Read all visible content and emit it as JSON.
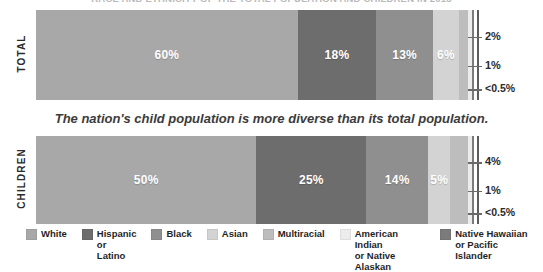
{
  "title": "RACE AND ETHNICITY OF THE TOTAL POPULATION AND CHILDREN IN 2018",
  "caption": "The nation's child population is more diverse than its total population.",
  "colors": {
    "white": "#a8a8a8",
    "hispanic_or_latino": "#6d6d6d",
    "black": "#8f8f8f",
    "asian": "#d3d3d3",
    "multiracial": "#bdbdbd",
    "american_indian_or_native_alaskan": "#ececec",
    "native_hawaiian_or_pacific_islander": "#7b7b7b",
    "axis": "#5b5b5b",
    "label_text": "#2b2b2b",
    "segment_text": "#ffffff"
  },
  "rows": [
    {
      "label": "TOTAL",
      "segments": [
        {
          "name": "White",
          "value": 60,
          "display": "60%",
          "show_label": true,
          "color_key": "white"
        },
        {
          "name": "Hispanic or Latino",
          "value": 18,
          "display": "18%",
          "show_label": true,
          "color_key": "hispanic_or_latino"
        },
        {
          "name": "Black",
          "value": 13,
          "display": "13%",
          "show_label": true,
          "color_key": "black"
        },
        {
          "name": "Asian",
          "value": 6,
          "display": "6%",
          "show_label": true,
          "color_key": "asian"
        },
        {
          "name": "Multiracial",
          "value": 2,
          "display": "2%",
          "show_label": false,
          "color_key": "multiracial"
        },
        {
          "name": "American Indian or Native Alaskan",
          "value": 1,
          "display": "1%",
          "show_label": false,
          "color_key": "american_indian_or_native_alaskan"
        },
        {
          "name": "Native Hawaiian or Pacific Islander",
          "value": 0.4,
          "display": "<0.5%",
          "show_label": false,
          "color_key": "native_hawaiian_or_pacific_islander"
        }
      ],
      "ticks": [
        {
          "label": "2%",
          "position_pct": 96.0
        },
        {
          "label": "1%",
          "position_pct": 98.5
        },
        {
          "label": "<0.5%",
          "position_pct": 99.8
        }
      ]
    },
    {
      "label": "CHILDREN",
      "segments": [
        {
          "name": "White",
          "value": 50,
          "display": "50%",
          "show_label": true,
          "color_key": "white"
        },
        {
          "name": "Hispanic or Latino",
          "value": 25,
          "display": "25%",
          "show_label": true,
          "color_key": "hispanic_or_latino"
        },
        {
          "name": "Black",
          "value": 14,
          "display": "14%",
          "show_label": true,
          "color_key": "black"
        },
        {
          "name": "Asian",
          "value": 5,
          "display": "5%",
          "show_label": true,
          "color_key": "asian"
        },
        {
          "name": "Multiracial",
          "value": 4,
          "display": "4%",
          "show_label": false,
          "color_key": "multiracial"
        },
        {
          "name": "American Indian or Native Alaskan",
          "value": 1,
          "display": "1%",
          "show_label": false,
          "color_key": "american_indian_or_native_alaskan"
        },
        {
          "name": "Native Hawaiian or Pacific Islander",
          "value": 0.4,
          "display": "<0.5%",
          "show_label": false,
          "color_key": "native_hawaiian_or_pacific_islander"
        }
      ],
      "ticks": [
        {
          "label": "4%",
          "position_pct": 95.5
        },
        {
          "label": "1%",
          "position_pct": 98.5
        },
        {
          "label": "<0.5%",
          "position_pct": 99.8
        }
      ]
    }
  ],
  "legend": [
    {
      "label_line1": "White",
      "label_line2": "",
      "color_key": "white"
    },
    {
      "label_line1": "Hispanic",
      "label_line2": "or Latino",
      "color_key": "hispanic_or_latino"
    },
    {
      "label_line1": "Black",
      "label_line2": "",
      "color_key": "black"
    },
    {
      "label_line1": "Asian",
      "label_line2": "",
      "color_key": "asian"
    },
    {
      "label_line1": "Multiracial",
      "label_line2": "",
      "color_key": "multiracial"
    },
    {
      "label_line1": "American Indian",
      "label_line2": "or Native Alaskan",
      "color_key": "american_indian_or_native_alaskan"
    },
    {
      "label_line1": "Native Hawaiian",
      "label_line2": "or Pacific Islander",
      "color_key": "native_hawaiian_or_pacific_islander"
    }
  ],
  "chart_data": {
    "type": "bar",
    "orientation": "horizontal",
    "stacked": true,
    "normalized_percent": true,
    "title": "RACE AND ETHNICITY OF THE TOTAL POPULATION AND CHILDREN IN 2018",
    "subtitle": "The nation's child population is more diverse than its total population.",
    "xlabel": "",
    "ylabel": "",
    "xlim": [
      0,
      100
    ],
    "grid": false,
    "legend_position": "bottom",
    "categories": [
      "TOTAL",
      "CHILDREN"
    ],
    "series": [
      {
        "name": "White",
        "values": [
          60,
          50
        ],
        "labels": [
          "60%",
          "50%"
        ]
      },
      {
        "name": "Hispanic or Latino",
        "values": [
          18,
          25
        ],
        "labels": [
          "18%",
          "25%"
        ]
      },
      {
        "name": "Black",
        "values": [
          13,
          14
        ],
        "labels": [
          "13%",
          "14%"
        ]
      },
      {
        "name": "Asian",
        "values": [
          6,
          5
        ],
        "labels": [
          "6%",
          "5%"
        ]
      },
      {
        "name": "Multiracial",
        "values": [
          2,
          4
        ],
        "labels": [
          "2%",
          "4%"
        ]
      },
      {
        "name": "American Indian or Native Alaskan",
        "values": [
          1,
          1
        ],
        "labels": [
          "1%",
          "1%"
        ]
      },
      {
        "name": "Native Hawaiian or Pacific Islander",
        "values": [
          0.4,
          0.4
        ],
        "labels": [
          "<0.5%",
          "<0.5%"
        ]
      }
    ],
    "annotations": [
      {
        "row": "TOTAL",
        "ticks": [
          "2%",
          "1%",
          "<0.5%"
        ]
      },
      {
        "row": "CHILDREN",
        "ticks": [
          "4%",
          "1%",
          "<0.5%"
        ]
      }
    ]
  }
}
